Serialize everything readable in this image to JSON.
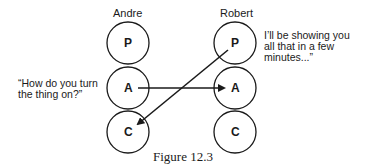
{
  "people": [
    {
      "name": "Andre",
      "states": [
        "P",
        "A",
        "C"
      ]
    },
    {
      "name": "Robert",
      "states": [
        "P",
        "A",
        "C"
      ]
    }
  ],
  "speech": {
    "andre": "“How do you turn the thing on?”",
    "andre_line1": "“How do you turn",
    "andre_line2": "the thing on?”",
    "robert_line1": "I’ll be showing you",
    "robert_line2": "all that in a few",
    "robert_line3": "minutes...”"
  },
  "arrows": [
    {
      "from": "Andre.A",
      "to": "Robert.A"
    },
    {
      "from": "Robert.P",
      "to": "Andre.C"
    }
  ],
  "caption": "Figure 12.3",
  "colors": {
    "ink": "#1a1a1a",
    "background": "#ffffff"
  }
}
